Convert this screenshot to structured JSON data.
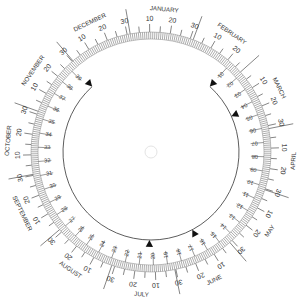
{
  "wheel": {
    "center": [
      151,
      152
    ],
    "colors": {
      "ink": "#333333",
      "band": "#8a8a8a",
      "background": "#ffffff"
    },
    "months": [
      {
        "label": "JANUARY",
        "days": 31
      },
      {
        "label": "FEBRUARY",
        "days": 28
      },
      {
        "label": "MARCH",
        "days": 31
      },
      {
        "label": "APRIL",
        "days": 30
      },
      {
        "label": "MAY",
        "days": 31
      },
      {
        "label": "JUNE",
        "days": 30
      },
      {
        "label": "JULY",
        "days": 31
      },
      {
        "label": "AUGUST",
        "days": 31
      },
      {
        "label": "SEPTEMBER",
        "days": 30
      },
      {
        "label": "OCTOBER",
        "days": 31
      },
      {
        "label": "NOVEMBER",
        "days": 30
      },
      {
        "label": "DECEMBER",
        "days": 31
      }
    ],
    "month_day_labels": [
      "10",
      "20",
      "30"
    ],
    "year_start_angle_deg": -10,
    "inner_ring": {
      "labels": [
        "01",
        "02",
        "03",
        "04",
        "05",
        "06",
        "07",
        "08",
        "09",
        "10",
        "11",
        "12",
        "13",
        "14",
        "15",
        "16",
        "17",
        "18",
        "19",
        "20",
        "21",
        "22",
        "23",
        "24",
        "25",
        "26",
        "27",
        "28",
        "29",
        "30",
        "31",
        "32",
        "33",
        "34",
        "35",
        "36",
        "37",
        "38",
        "39"
      ],
      "start_angle_deg": 42,
      "step_deg": 7.2
    },
    "markers": [
      {
        "name": "cycle-start-marker",
        "angle_deg": 42
      },
      {
        "name": "marker-day-04",
        "angle_deg": 66
      },
      {
        "name": "marker-day-16",
        "angle_deg": 152
      },
      {
        "name": "marker-day-20",
        "angle_deg": 181
      },
      {
        "name": "cycle-end-marker",
        "angle_deg": 318
      }
    ],
    "center_knob": "pivot-icon"
  }
}
